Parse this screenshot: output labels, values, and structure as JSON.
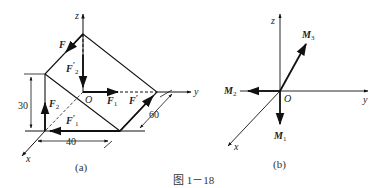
{
  "figure_caption": "图 1－18",
  "panel_a": {
    "caption": "(a)",
    "axes": {
      "x": "x",
      "y": "y",
      "z": "z"
    },
    "origin": "O",
    "forces": {
      "F": "F",
      "F2_prime": "F′2",
      "F1": "F1",
      "F_prime": "F′",
      "F2": "F2",
      "F1_prime": "F′1"
    },
    "dimensions": {
      "height": "30",
      "width": "40",
      "depth": "60"
    }
  },
  "panel_b": {
    "caption": "(b)",
    "axes": {
      "x": "x",
      "y": "y",
      "z": "z"
    },
    "origin": "O",
    "moments": {
      "M1": "M1",
      "M2": "M2",
      "M3": "M3"
    }
  }
}
